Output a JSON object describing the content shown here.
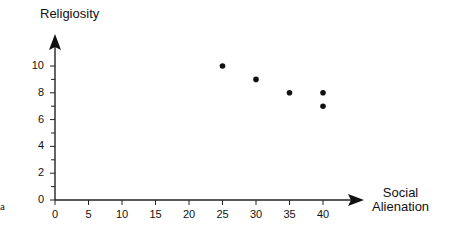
{
  "chart_data": {
    "type": "scatter",
    "title": "",
    "xlabel": "Social Alienation",
    "ylabel": "Religiosity",
    "xlim": [
      0,
      40
    ],
    "ylim": [
      0,
      10
    ],
    "x_ticks": [
      0,
      5,
      10,
      15,
      20,
      25,
      30,
      35,
      40
    ],
    "y_ticks": [
      0,
      2,
      4,
      6,
      8,
      10
    ],
    "y_minor_ticks": [
      1,
      3,
      5,
      7,
      9
    ],
    "grid": false,
    "legend": null,
    "points": [
      {
        "x": 25,
        "y": 10
      },
      {
        "x": 30,
        "y": 9
      },
      {
        "x": 35,
        "y": 8
      },
      {
        "x": 40,
        "y": 8
      },
      {
        "x": 40,
        "y": 7
      }
    ]
  },
  "labels": {
    "ylabel": "Religiosity",
    "xlabel_line1": "Social",
    "xlabel_line2": "Alienation",
    "edge_fragment": "a"
  }
}
